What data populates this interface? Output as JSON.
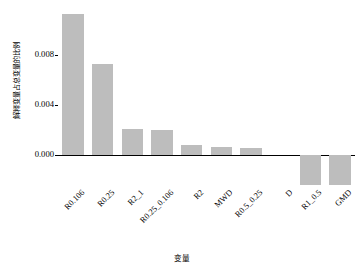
{
  "chart_data": {
    "type": "bar",
    "title": "",
    "xlabel": "变量",
    "ylabel": "解释变量占总变量的比例",
    "categories": [
      "R0.106",
      "R0.25",
      "R2_1",
      "R0.25_0.106",
      "R2",
      "MWD",
      "R0.5_0.25",
      "D",
      "R1_0.5",
      "GMD"
    ],
    "values": [
      0.01125,
      0.0073,
      0.00206,
      0.00197,
      0.0008,
      0.00068,
      0.00055,
      0.0,
      -0.00243,
      -0.00243
    ],
    "ytick_labels": [
      "0.000",
      "0.004",
      "0.008"
    ],
    "ytick_values": [
      0.0,
      0.004,
      0.008
    ],
    "ylim": [
      -0.0028,
      0.0118
    ],
    "grid": false,
    "legend": false,
    "bar_color": "#bdbdbd",
    "axis_color": "#000000"
  }
}
